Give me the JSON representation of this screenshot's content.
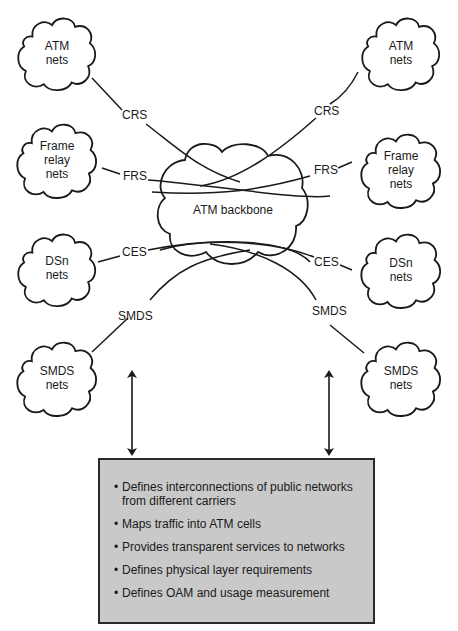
{
  "diagram": {
    "backbone": {
      "label": "ATM  backbone"
    },
    "left_clouds": [
      {
        "id": "atm",
        "line1": "ATM",
        "line2": "nets"
      },
      {
        "id": "frame-relay",
        "line1": "Frame",
        "line2": "relay",
        "line3": "nets"
      },
      {
        "id": "dsn",
        "line1": "DSn",
        "line2": "nets"
      },
      {
        "id": "smds",
        "line1": "SMDS",
        "line2": "nets"
      }
    ],
    "right_clouds": [
      {
        "id": "atm",
        "line1": "ATM",
        "line2": "nets"
      },
      {
        "id": "frame-relay",
        "line1": "Frame",
        "line2": "relay",
        "line3": "nets"
      },
      {
        "id": "dsn",
        "line1": "DSn",
        "line2": "nets"
      },
      {
        "id": "smds",
        "line1": "SMDS",
        "line2": "nets"
      }
    ],
    "connection_labels": {
      "left": [
        "CRS",
        "FRS",
        "CES",
        "SMDS"
      ],
      "right": [
        "CRS",
        "FRS",
        "CES",
        "SMDS"
      ]
    },
    "info_box": {
      "items": [
        "Defines interconnections of public networks from different carriers",
        "Maps traffic into ATM cells",
        "Provides transparent services to networks",
        "Defines physical layer requirements",
        "Defines OAM and usage measurement"
      ],
      "fill_color": "#c9c9c9",
      "border_color": "#2a2a2a"
    }
  }
}
